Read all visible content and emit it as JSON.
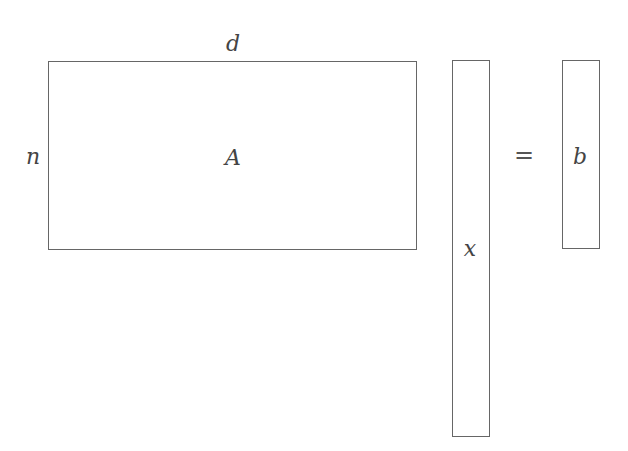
{
  "diagram": {
    "matrix_A": {
      "label": "A",
      "rows_label": "n",
      "cols_label": "d"
    },
    "vector_x": {
      "label": "x"
    },
    "equals": "=",
    "vector_b": {
      "label": "b"
    }
  },
  "colors": {
    "stroke": "#666666",
    "text": "#444444",
    "background": "#ffffff"
  }
}
